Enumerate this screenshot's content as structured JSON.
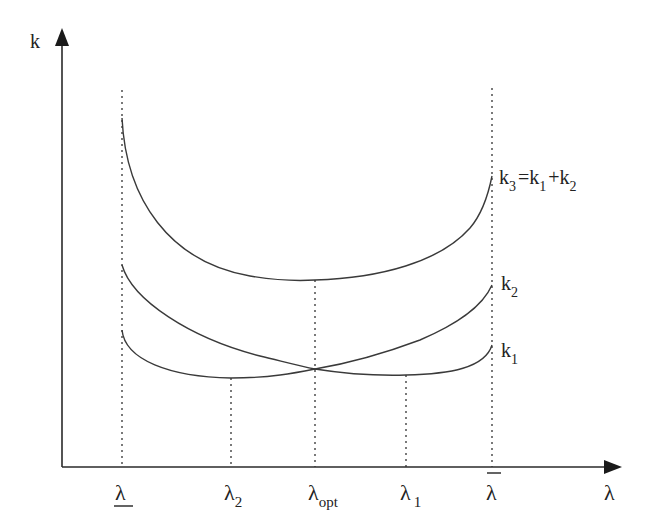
{
  "diagram": {
    "type": "cost-curves",
    "colors": {
      "ink": "#2a2a2a",
      "background": "#ffffff"
    },
    "axes": {
      "y_label": "k",
      "x_label": "λ"
    },
    "x_ticks": [
      {
        "id": "lambda_lower",
        "label": "λ",
        "decoration": "underline",
        "x": 122
      },
      {
        "id": "lambda_2",
        "label": "λ",
        "sub": "2",
        "x": 231
      },
      {
        "id": "lambda_opt",
        "label": "λ",
        "sub": "opt",
        "x": 315
      },
      {
        "id": "lambda_1",
        "label": "λ",
        "sub": "1",
        "x": 406
      },
      {
        "id": "lambda_upper",
        "label": "λ",
        "decoration": "overline",
        "x": 492
      }
    ],
    "curves": [
      {
        "id": "k3",
        "label_main": "k",
        "label_sub": "3",
        "label_rest_1": "=k",
        "label_sub_1": "1",
        "label_rest_2": "+k",
        "label_sub_2": "2",
        "description": "sum curve, U-shaped with minimum at λopt"
      },
      {
        "id": "k2",
        "label_main": "k",
        "label_sub": "2",
        "description": "U-shaped, crosses k1 at λopt"
      },
      {
        "id": "k1",
        "label_main": "k",
        "label_sub": "1",
        "description": "W-shaped with minima at λ2 and λ1, crosses k2 at λopt"
      }
    ]
  }
}
